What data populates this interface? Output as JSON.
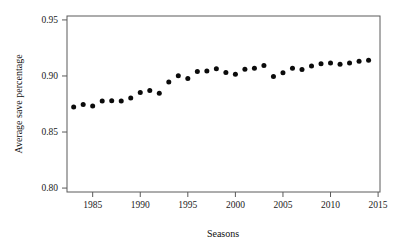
{
  "chart_data": {
    "type": "scatter",
    "title": "",
    "xlabel": "Seasons",
    "ylabel": "Average save percentage",
    "xlim": [
      1982.3,
      2015.2
    ],
    "ylim": [
      0.7965,
      0.9535
    ],
    "grid": false,
    "legend": "none",
    "xticks": [
      1985,
      1990,
      1995,
      2000,
      2005,
      2010,
      2015
    ],
    "xticklabels": [
      "1985",
      "1990",
      "1995",
      "2000",
      "2005",
      "2010",
      "2015"
    ],
    "yticks": [
      0.8,
      0.85,
      0.9,
      0.95
    ],
    "yticklabels": [
      "0.80",
      "0.85",
      "0.90",
      "0.95"
    ],
    "marker": "filled-circle",
    "marker_color": "#0b0b0b",
    "x": [
      1983,
      1984,
      1985,
      1986,
      1987,
      1988,
      1989,
      1990,
      1991,
      1992,
      1993,
      1994,
      1995,
      1996,
      1997,
      1998,
      1999,
      2000,
      2001,
      2002,
      2003,
      2004,
      2005,
      2006,
      2007,
      2008,
      2009,
      2010,
      2011,
      2012,
      2013,
      2014
    ],
    "values": [
      0.8723,
      0.8745,
      0.8733,
      0.8777,
      0.8779,
      0.8776,
      0.8803,
      0.8853,
      0.8871,
      0.8846,
      0.8946,
      0.9001,
      0.8977,
      0.904,
      0.9045,
      0.9065,
      0.903,
      0.9015,
      0.906,
      0.9068,
      0.9093,
      0.8995,
      0.9029,
      0.9069,
      0.9057,
      0.9089,
      0.911,
      0.9116,
      0.9105,
      0.9116,
      0.9131,
      0.914
    ]
  },
  "axes": {
    "y_title": "Average save percentage",
    "x_title": "Seasons"
  }
}
